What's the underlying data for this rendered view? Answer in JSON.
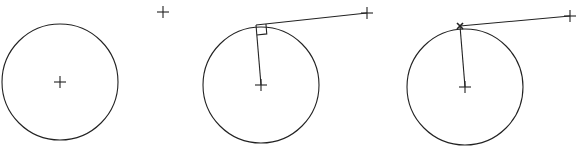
{
  "diagram": {
    "stroke_color": "#222222",
    "panels": [
      {
        "id": "step-1",
        "circle": {
          "cx": 60,
          "cy": 82,
          "r": 58
        },
        "center_mark": {
          "x": 60,
          "y": 82
        },
        "external_point": {
          "x": 163,
          "y": 12
        }
      },
      {
        "id": "step-2",
        "circle": {
          "cx": 261,
          "cy": 85,
          "r": 58
        },
        "center_mark": {
          "x": 261,
          "y": 85
        },
        "external_point": {
          "x": 367,
          "y": 13
        },
        "tangent_point": {
          "x": 256,
          "y": 25
        },
        "right_angle_marker": true
      },
      {
        "id": "step-3",
        "circle": {
          "cx": 465,
          "cy": 87,
          "r": 58
        },
        "center_mark": {
          "x": 465,
          "y": 87
        },
        "external_point": {
          "x": 570,
          "y": 16
        },
        "tangent_point": {
          "x": 460,
          "y": 26
        },
        "tangent_point_marker": "x-mark"
      }
    ]
  }
}
